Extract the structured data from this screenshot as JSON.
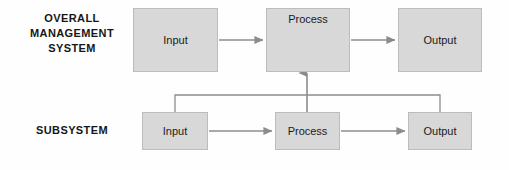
{
  "diagram": {
    "background_color": "#fefefe",
    "box_fill_color": "#d8d8d8",
    "box_border_color": "#bcbcbc",
    "connector_color": "#8c8c8c",
    "text_color": "#1a1a1a",
    "rows": {
      "overall": {
        "label": "OVERALL\nMANAGEMENT\nSYSTEM",
        "nodes": {
          "input": "Input",
          "process": "Process",
          "output": "Output"
        }
      },
      "subsystem": {
        "label": "SUBSYSTEM",
        "nodes": {
          "input": "Input",
          "process": "Process",
          "output": "Output"
        }
      }
    }
  }
}
